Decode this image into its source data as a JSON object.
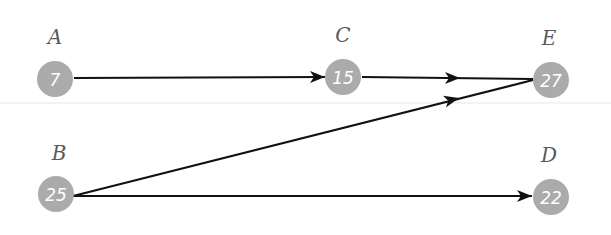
{
  "diagram": {
    "background_color": "#ffffff",
    "node_fill_color": "#ababab",
    "node_value_color": "#ffffff",
    "node_label_color": "#58595b",
    "edge_color": "#111111",
    "divider_color": "#efeff1",
    "node_radius": 18,
    "divider": {
      "name": "horizontal-divider",
      "y": 103,
      "x1": 0,
      "x2": 611
    },
    "nodes": [
      {
        "id": "A",
        "label": "A",
        "value": "7",
        "cx": 55,
        "cy": 79,
        "label_x": 55,
        "label_y": 44
      },
      {
        "id": "C",
        "label": "C",
        "value": "15",
        "cx": 343,
        "cy": 77,
        "label_x": 343,
        "label_y": 42
      },
      {
        "id": "E",
        "label": "E",
        "value": "27",
        "cx": 551,
        "cy": 80,
        "label_x": 549,
        "label_y": 45
      },
      {
        "id": "B",
        "label": "B",
        "value": "25",
        "cx": 56,
        "cy": 194,
        "label_x": 59,
        "label_y": 160
      },
      {
        "id": "D",
        "label": "D",
        "value": "22",
        "cx": 551,
        "cy": 197,
        "label_x": 549,
        "label_y": 162
      }
    ],
    "edges": [
      {
        "id": "A-C",
        "from": "A",
        "to": "C",
        "x1": 74,
        "y1": 78,
        "x2": 325,
        "y2": 77,
        "arrow_x": 325,
        "arrow_y": 77,
        "arrow_angle": 0
      },
      {
        "id": "C-E",
        "from": "C",
        "to": "E",
        "x1": 362,
        "y1": 77,
        "x2": 533,
        "y2": 79,
        "arrow_x": 460,
        "arrow_y": 78,
        "arrow_angle": 0
      },
      {
        "id": "B-E",
        "from": "B",
        "to": "E",
        "x1": 73,
        "y1": 196,
        "x2": 533,
        "y2": 80,
        "arrow_x": 459,
        "arrow_y": 98,
        "arrow_angle": -14
      },
      {
        "id": "B-D",
        "from": "B",
        "to": "D",
        "x1": 73,
        "y1": 196,
        "x2": 532,
        "y2": 196,
        "arrow_x": 532,
        "arrow_y": 196,
        "arrow_angle": 0
      }
    ]
  }
}
